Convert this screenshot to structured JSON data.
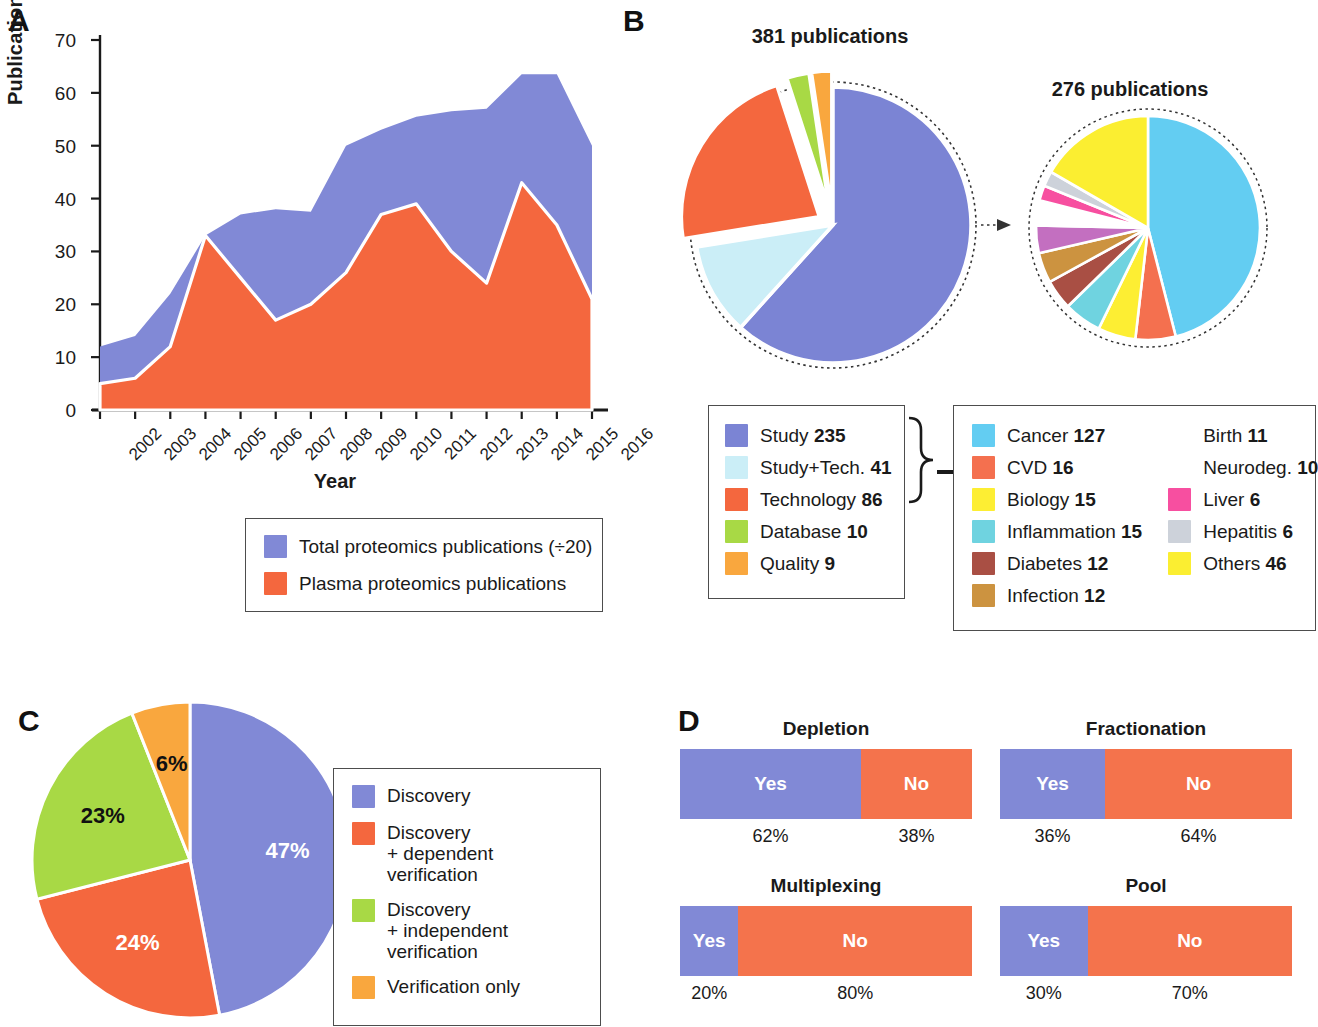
{
  "panels": {
    "a": {
      "letter": "A",
      "ylabel": "Publications/Year",
      "xlabel": "Year",
      "legend": [
        {
          "label": "Total proteomics publications (÷20)",
          "color": "#8189d6"
        },
        {
          "label": "Plasma proteomics publications",
          "color": "#f4673e"
        }
      ]
    },
    "b": {
      "letter": "B",
      "pie_left_title": "381 publications",
      "pie_right_title": "276 publications",
      "legend_left": [
        {
          "label": "Study",
          "value": "235",
          "color": "#7b84d4"
        },
        {
          "label": "Study+Tech.",
          "value": "41",
          "color": "#cbeef7"
        },
        {
          "label": "Technology",
          "value": "86",
          "color": "#f4673e"
        },
        {
          "label": "Database",
          "value": "10",
          "color": "#a8d945"
        },
        {
          "label": "Quality",
          "value": "9",
          "color": "#f9a73e"
        }
      ],
      "legend_right_col1": [
        {
          "label": "Cancer",
          "value": "127",
          "color": "#63cdf2"
        },
        {
          "label": "CVD",
          "value": "16",
          "color": "#f4704f"
        },
        {
          "label": "Biology",
          "value": "15",
          "color": "#fdee33"
        },
        {
          "label": "Inflammation",
          "value": "15",
          "color": "#6fd3e0"
        },
        {
          "label": "Diabetes",
          "value": "12",
          "color": "#a94f44"
        },
        {
          "label": "Infection",
          "value": "12",
          "color": "#cc9340"
        }
      ],
      "legend_right_col2": [
        {
          "label": "Birth",
          "value": "11",
          "color": "#c munoz"
        },
        {
          "label": "Neurodeg.",
          "value": "10",
          "color": "none"
        },
        {
          "label": "Liver",
          "value": "6",
          "color": "#f74fa0"
        },
        {
          "label": "Hepatitis",
          "value": "6",
          "color": "#cdd2da"
        },
        {
          "label": "Others",
          "value": "46",
          "color": "#fbee31"
        }
      ]
    },
    "c": {
      "letter": "C",
      "legend": [
        {
          "label": "Discovery",
          "color": "#8189d6"
        },
        {
          "label": "Discovery\n+ dependent verification",
          "color": "#f4673e"
        },
        {
          "label": "Discovery\n+ independent verification",
          "color": "#a8d945"
        },
        {
          "label": "Verification only",
          "color": "#f9a73e"
        }
      ]
    },
    "d": {
      "letter": "D"
    }
  },
  "watermark": "EMBO",
  "chart_data": [
    {
      "type": "area",
      "id": "panel-a-area",
      "title": "",
      "xlabel": "Year",
      "ylabel": "Publications/Year",
      "ylim": [
        0,
        70
      ],
      "yticks": [
        0,
        10,
        20,
        30,
        40,
        50,
        60,
        70
      ],
      "grid": false,
      "legend_position": "below",
      "categories": [
        2002,
        2003,
        2004,
        2005,
        2006,
        2007,
        2008,
        2009,
        2010,
        2011,
        2012,
        2013,
        2014,
        2015,
        2016
      ],
      "series": [
        {
          "name": "Total proteomics publications (÷20)",
          "color": "#8189d6",
          "values": [
            12,
            14,
            22,
            33,
            37,
            38,
            37.5,
            50,
            53,
            55.5,
            56.5,
            57,
            63.5,
            63.5,
            50
          ]
        },
        {
          "name": "Plasma proteomics publications",
          "color": "#f4673e",
          "values": [
            5,
            6,
            12,
            33,
            25,
            17,
            20,
            26,
            37,
            39,
            30,
            24,
            43,
            35,
            21
          ]
        }
      ]
    },
    {
      "type": "pie",
      "id": "panel-b-left-pie",
      "title": "381 publications",
      "total": 381,
      "labels": [
        "Study",
        "Study+Tech.",
        "Technology",
        "Database",
        "Quality"
      ],
      "values": [
        235,
        41,
        86,
        10,
        9
      ],
      "colors": [
        "#7b84d4",
        "#cbeef7",
        "#f4673e",
        "#a8d945",
        "#f9a73e"
      ],
      "exploded": [
        "Technology",
        "Database",
        "Quality"
      ],
      "grouped_outline": [
        "Study",
        "Study+Tech."
      ]
    },
    {
      "type": "pie",
      "id": "panel-b-right-pie",
      "title": "276 publications",
      "total": 276,
      "labels": [
        "Cancer",
        "CVD",
        "Biology",
        "Inflammation",
        "Diabetes",
        "Infection",
        "Birth",
        "Neurodeg.",
        "Liver",
        "Hepatitis",
        "Others"
      ],
      "values": [
        127,
        16,
        15,
        15,
        12,
        12,
        11,
        10,
        6,
        6,
        46
      ],
      "colors": [
        "#63cdf2",
        "#f4704f",
        "#fdee33",
        "#6fd3e0",
        "#a94f44",
        "#cc9340",
        "#c36fc0",
        "#ffffff",
        "#f74fa0",
        "#cdd2da",
        "#fbee31"
      ]
    },
    {
      "type": "pie",
      "id": "panel-c-pie",
      "title": "",
      "labels": [
        "Discovery",
        "Discovery + dependent verification",
        "Discovery + independent verification",
        "Verification only"
      ],
      "values": [
        47,
        24,
        23,
        6
      ],
      "value_labels": [
        "47%",
        "24%",
        "23%",
        "6%"
      ],
      "colors": [
        "#8189d6",
        "#f4673e",
        "#a8d945",
        "#f9a73e"
      ],
      "label_colors": [
        "#ffffff",
        "#ffffff",
        "#111111",
        "#111111"
      ]
    },
    {
      "type": "bar",
      "id": "panel-d-stacked-bars",
      "orientation": "horizontal-stacked",
      "groups": [
        {
          "title": "Depletion",
          "segments": [
            {
              "label": "Yes",
              "value": 62,
              "pct": "62%",
              "color": "#8189d6"
            },
            {
              "label": "No",
              "value": 38,
              "pct": "38%",
              "color": "#f4734c"
            }
          ]
        },
        {
          "title": "Fractionation",
          "segments": [
            {
              "label": "Yes",
              "value": 36,
              "pct": "36%",
              "color": "#8189d6"
            },
            {
              "label": "No",
              "value": 64,
              "pct": "64%",
              "color": "#f4734c"
            }
          ]
        },
        {
          "title": "Multiplexing",
          "segments": [
            {
              "label": "Yes",
              "value": 20,
              "pct": "20%",
              "color": "#8189d6"
            },
            {
              "label": "No",
              "value": 80,
              "pct": "80%",
              "color": "#f4734c"
            }
          ]
        },
        {
          "title": "Pool",
          "segments": [
            {
              "label": "Yes",
              "value": 30,
              "pct": "30%",
              "color": "#8189d6"
            },
            {
              "label": "No",
              "value": 70,
              "pct": "70%",
              "color": "#f4734c"
            }
          ]
        }
      ]
    }
  ]
}
